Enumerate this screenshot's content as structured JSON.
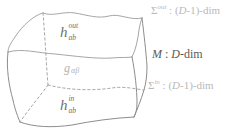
{
  "figure": {
    "type": "manifold-boundary-diagram",
    "background": "#ffffff",
    "colors": {
      "edge_light": "#a6a6a6",
      "edge_dark": "#8d8d8d",
      "label_dark_gray": "#6f6f6f",
      "label_light_gray": "#b2b2b2",
      "label_black": "#5a5a5a"
    }
  },
  "box_labels": {
    "h_out": {
      "base": "h",
      "sup": "out",
      "sub": "ab"
    },
    "g_bulk": {
      "base": "g",
      "sub": "αβ"
    },
    "h_in": {
      "base": "h",
      "sup": "in",
      "sub": "ab"
    }
  },
  "side_labels": {
    "sigma_out": {
      "sym": "Σ",
      "sup": "out",
      "sep": " : (",
      "dim_var": "D",
      "tail": "-1)-dim"
    },
    "m_bulk": {
      "var": "M",
      "sep": " : ",
      "dim_var": "D",
      "tail": "-dim"
    },
    "sigma_in": {
      "sym": "Σ",
      "sup": "in",
      "sep": " : (",
      "dim_var": "D",
      "tail": "-1)-dim"
    }
  }
}
